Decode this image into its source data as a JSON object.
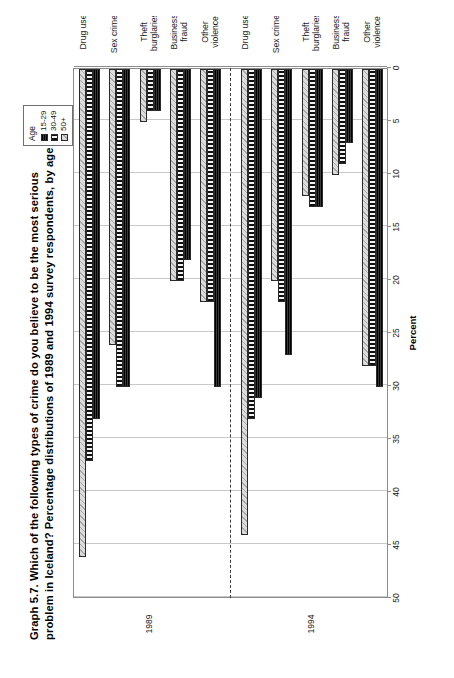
{
  "figure": {
    "title_line1": "Graph 5.7.  Which of the following types of crime do you believe to be the most serious",
    "title_line2": "problem in Iceland? Percentage distributions of 1989 and 1994 survey respondents, by age"
  },
  "legend": {
    "title": "Age",
    "items": [
      {
        "label": "15-29",
        "key": "s1"
      },
      {
        "label": "30-49",
        "key": "s2"
      },
      {
        "label": "50+",
        "key": "s3"
      }
    ]
  },
  "periods": [
    {
      "label": "1989"
    },
    {
      "label": "1994"
    }
  ],
  "chart_data": {
    "type": "bar",
    "orientation": "horizontal",
    "title": "Graph 5.7.  Which of the following types of crime do you believe to be the most serious problem in Iceland? Percentage distributions of 1989 and 1994 survey respondents, by age",
    "xlabel": "Percent",
    "ylabel": "",
    "xlim": [
      0,
      50
    ],
    "xticks": [
      50,
      45,
      40,
      35,
      30,
      25,
      20,
      15,
      10,
      5,
      0
    ],
    "xtick_labels": [
      "50",
      "45",
      "40",
      "35",
      "30",
      "25",
      "20",
      "15",
      "10",
      "5",
      "0"
    ],
    "axis_reversed": true,
    "grid": "vertical",
    "legend_position": "top-right",
    "legend_title": "Age",
    "series": [
      {
        "name": "15-29",
        "values": [
          33,
          30,
          4,
          18,
          30,
          31,
          27,
          13,
          7,
          30
        ]
      },
      {
        "name": "30-49",
        "values": [
          37,
          30,
          4,
          20,
          22,
          33,
          22,
          13,
          9,
          28
        ]
      },
      {
        "name": "50+",
        "values": [
          46,
          26,
          5,
          20,
          22,
          44,
          20,
          12,
          10,
          28
        ]
      }
    ],
    "categories": [
      "Drug use",
      "Sex crimes",
      "Theft\nburglaries",
      "Business\nfraud",
      "Other\nviolence",
      "Drug use",
      "Sex crimes",
      "Theft\nburglaries",
      "Business\nfraud",
      "Other\nviolence"
    ],
    "group_labels": [
      "1989",
      "1989",
      "1989",
      "1989",
      "1989",
      "1994",
      "1994",
      "1994",
      "1994",
      "1994"
    ],
    "annotations": [
      {
        "type": "dashed-separator",
        "between_categories": [
          4,
          5
        ],
        "label": "divides 1989 and 1994 survey results"
      }
    ]
  },
  "colors": {
    "series_15_29": "#1d1d1d",
    "series_30_49": "#111111",
    "series_50_plus": "#dcdcdc",
    "gridline": "#c9c9c9",
    "axis": "#8c8c8c",
    "frame": "#9a9a9a",
    "text": "#1a1a1a"
  }
}
